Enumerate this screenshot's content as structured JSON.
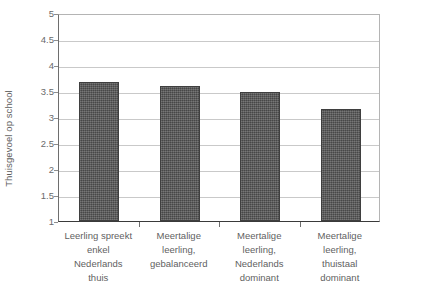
{
  "chart_data": {
    "type": "bar",
    "title": "",
    "xlabel": "",
    "ylabel": "Thuisgevoel op school",
    "ylim": [
      1,
      5
    ],
    "yticks": [
      1,
      1.5,
      2,
      2.5,
      3,
      3.5,
      4,
      4.5,
      5
    ],
    "ytick_labels": [
      "1",
      "1.5",
      "2",
      "2.5",
      "3",
      "3.5",
      "4",
      "4.5",
      "5"
    ],
    "grid": true,
    "legend": null,
    "legend_position": "none",
    "categories": [
      "Leerling spreekt enkel Nederlands thuis",
      "Meertalige leerling, gebalanceerd",
      "Meertalige leerling, Nederlands dominant",
      "Meertalige leerling, thuistaal dominant"
    ],
    "category_lines": [
      [
        "Leerling spreekt",
        "enkel",
        "Nederlands",
        "thuis"
      ],
      [
        "Meertalige",
        "leerling,",
        "gebalanceerd"
      ],
      [
        "Meertalige",
        "leerling,",
        "Nederlands",
        "dominant"
      ],
      [
        "Meertalige",
        "leerling,",
        "thuistaal",
        "dominant"
      ]
    ],
    "values": [
      3.67,
      3.6,
      3.49,
      3.15
    ],
    "bar_color": "#575757",
    "bar_border_color": "#3f3f3f",
    "gridline_color": "#c9c9c9",
    "axis_color": "#3a3a3a",
    "text_color": "#5f5f5f"
  }
}
